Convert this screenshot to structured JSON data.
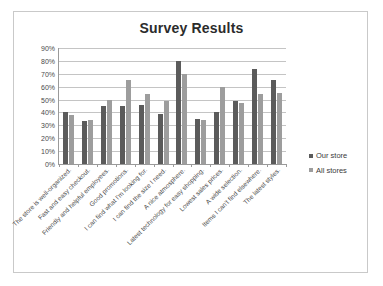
{
  "chart_data": {
    "type": "bar",
    "title": "Survey Results",
    "xlabel": "",
    "ylabel": "",
    "ylim": [
      0,
      90
    ],
    "ytick_labels": [
      "90%",
      "80%",
      "70%",
      "60%",
      "50%",
      "40%",
      "30%",
      "20%",
      "10%",
      "0%"
    ],
    "ytick_values": [
      90,
      80,
      70,
      60,
      50,
      40,
      30,
      20,
      10,
      0
    ],
    "grid": true,
    "legend_position": "right",
    "categories": [
      "The store is well-organized.",
      "Fast and easy checkout.",
      "Friendly and helpful employees.",
      "Good promotions.",
      "I can find what I'm looking for.",
      "I can find the size I need.",
      "A nice atmosphere.",
      "Latest technology for easy shopping.",
      "Lowest sales prices.",
      "A wide selection.",
      "Items I can't find elsewhere.",
      "The latest styles."
    ],
    "series": [
      {
        "name": "Our store",
        "color": "#5b5b5b",
        "values": [
          40,
          33,
          45,
          45,
          46,
          39,
          80,
          35,
          40,
          49,
          74,
          65
        ]
      },
      {
        "name": "All stores",
        "color": "#9d9d9d",
        "values": [
          38,
          34,
          50,
          65,
          54,
          49,
          70,
          34,
          60,
          47,
          54,
          55
        ]
      }
    ]
  }
}
